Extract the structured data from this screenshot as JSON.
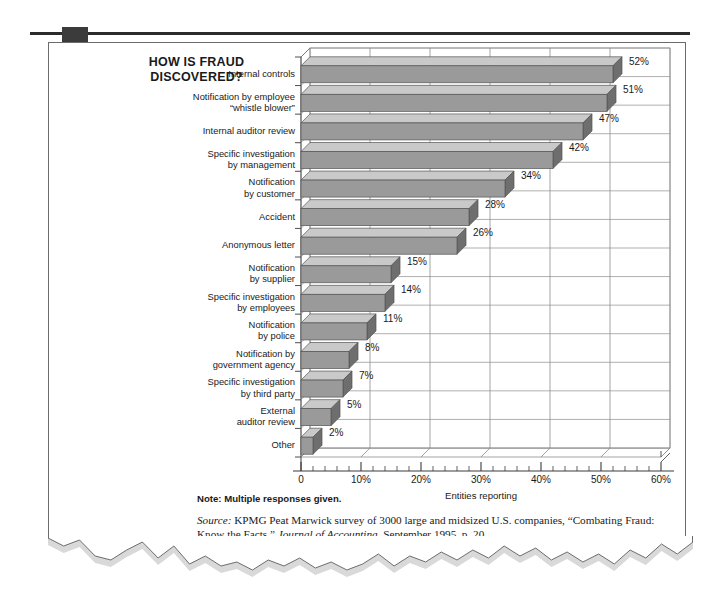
{
  "figure": {
    "heading_line1": "HOW IS FRAUD",
    "heading_line2": "DISCOVERED?",
    "note": "Note: Multiple responses given.",
    "source_label": "Source:",
    "source_text_1": " KPMG Peat Marwick survey of 3000 large and midsized U.S. companies, “Combating Fraud: Know the Facts,” ",
    "source_italic_2": "Journal of Accounting",
    "source_text_3": ", September 1995, p. 20."
  },
  "colors": {
    "bar_front": "#9a9a9a",
    "bar_top": "#c9c9c9",
    "bar_side": "#6e6e6e",
    "grid": "#8d8d8d",
    "axis": "#3a3a3a",
    "rule": "#2b2b2b",
    "marker": "#3b3b3b",
    "shadow": "#d9d9d9",
    "card_border": "#6b6b6b"
  },
  "chart_data": {
    "type": "bar",
    "orientation": "horizontal",
    "title": "HOW IS FRAUD DISCOVERED?",
    "xlabel": "Entities reporting",
    "ylabel": "",
    "xlim": [
      0,
      60
    ],
    "xticks": [
      0,
      10,
      20,
      30,
      40,
      50,
      60
    ],
    "xticklabels": [
      "0",
      "10%",
      "20%",
      "30%",
      "40%",
      "50%",
      "60%"
    ],
    "minor_tick_interval": 2,
    "grid": true,
    "grid_axis": "x",
    "legend": false,
    "value_suffix": "%",
    "categories": [
      "Internal controls",
      "Notification by employee “whistle blower”",
      "Internal auditor review",
      "Specific investigation by management",
      "Notification by customer",
      "Accident",
      "Anonymous letter",
      "Notification by supplier",
      "Specific investigation by employees",
      "Notification by police",
      "Notification by government agency",
      "Specific investigation by third party",
      "External auditor review",
      "Other"
    ],
    "values": [
      52,
      51,
      47,
      42,
      34,
      28,
      26,
      15,
      14,
      11,
      8,
      7,
      5,
      2
    ],
    "value_labels": [
      "52%",
      "51%",
      "47%",
      "42%",
      "34%",
      "28%",
      "26%",
      "15%",
      "14%",
      "11%",
      "8%",
      "7%",
      "5%",
      "2%"
    ]
  },
  "category_label_lines": [
    [
      "Internal controls"
    ],
    [
      "Notification by employee",
      "“whistle blower”"
    ],
    [
      "Internal auditor review"
    ],
    [
      "Specific investigation",
      "by management"
    ],
    [
      "Notification",
      "by customer"
    ],
    [
      "Accident"
    ],
    [
      "Anonymous letter"
    ],
    [
      "Notification",
      "by supplier"
    ],
    [
      "Specific investigation",
      "by employees"
    ],
    [
      "Notification",
      "by police"
    ],
    [
      "Notification by",
      "government agency"
    ],
    [
      "Specific investigation",
      "by third party"
    ],
    [
      "External",
      "auditor review"
    ],
    [
      "Other"
    ]
  ]
}
